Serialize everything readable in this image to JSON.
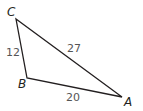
{
  "diagram": {
    "type": "triangle",
    "stroke_color": "#231f20",
    "vertices": [
      {
        "name": "C",
        "label": "C"
      },
      {
        "name": "B",
        "label": "B"
      },
      {
        "name": "A",
        "label": "A"
      }
    ],
    "sides": [
      {
        "between": "CB",
        "label": "12"
      },
      {
        "between": "CA",
        "label": "27"
      },
      {
        "between": "BA",
        "label": "20"
      }
    ]
  }
}
